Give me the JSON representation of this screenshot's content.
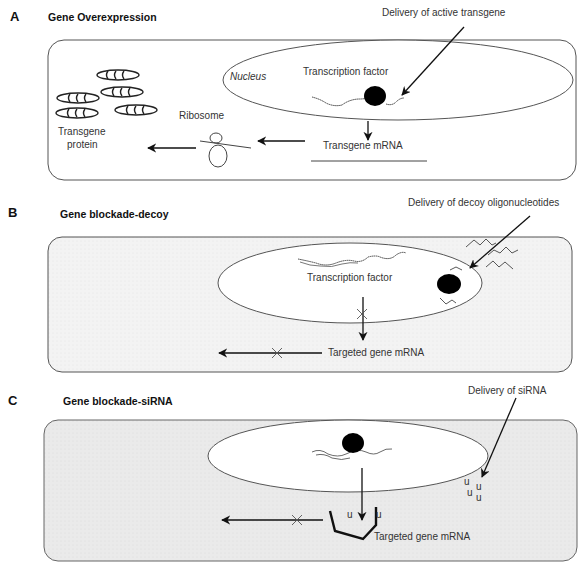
{
  "panels": [
    {
      "letter": "A",
      "title": "Gene Overexpression",
      "labels": {
        "delivery": "Delivery of active transgene",
        "nucleus": "Nucleus",
        "transcription_factor": "Transcription factor",
        "mrna": "Transgene mRNA",
        "ribosome": "Ribosome",
        "protein_line1": "Transgene",
        "protein_line2": "protein"
      }
    },
    {
      "letter": "B",
      "title": "Gene blockade-decoy",
      "labels": {
        "delivery": "Delivery of decoy oligonucleotides",
        "transcription_factor": "Transcription factor",
        "mrna": "Targeted gene mRNA"
      }
    },
    {
      "letter": "C",
      "title": "Gene blockade-siRNA",
      "labels": {
        "delivery": "Delivery of siRNA",
        "mrna": "Targeted gene mRNA",
        "sirna_glyph": "u"
      }
    }
  ],
  "colors": {
    "cell_fill_a": "#ffffff",
    "cell_fill_b": "#f4f4f4",
    "cell_fill_c": "#ececec",
    "stroke": "#444444",
    "ink": "#111111"
  }
}
